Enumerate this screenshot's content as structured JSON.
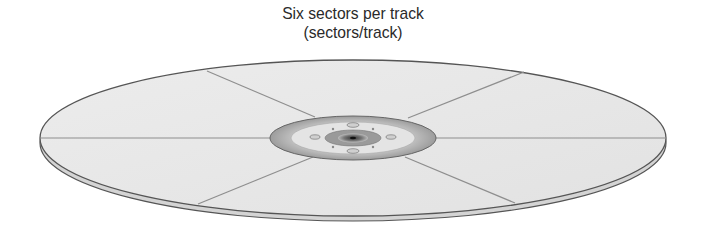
{
  "diagram": {
    "title_line1": "Six sectors per track",
    "title_line2": "(sectors/track)",
    "sector_count": 6,
    "colors": {
      "platter": "#e6e6e6",
      "edge": "#555555",
      "sector_line": "#8a8a8a",
      "hub": "#9a9a9a"
    }
  }
}
